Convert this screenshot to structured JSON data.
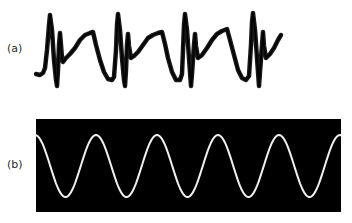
{
  "figure": {
    "panels": [
      {
        "label": "(a)",
        "description": "Noisy biological signal trace (ECG-like) with sharp spikes followed by a broad plateau",
        "trace_color": "#000000",
        "background": "#ffffff",
        "points": [
          [
            36,
            74
          ],
          [
            40,
            75
          ],
          [
            43,
            73
          ],
          [
            45,
            68
          ],
          [
            47,
            50
          ],
          [
            49,
            25
          ],
          [
            50,
            15
          ],
          [
            52,
            30
          ],
          [
            54,
            60
          ],
          [
            56,
            80
          ],
          [
            57,
            86
          ],
          [
            58,
            70
          ],
          [
            59,
            45
          ],
          [
            60,
            33
          ],
          [
            61,
            45
          ],
          [
            62,
            58
          ],
          [
            63,
            62
          ],
          [
            66,
            58
          ],
          [
            70,
            54
          ],
          [
            75,
            48
          ],
          [
            80,
            40
          ],
          [
            85,
            35
          ],
          [
            90,
            33
          ],
          [
            93,
            32
          ],
          [
            96,
            45
          ],
          [
            100,
            60
          ],
          [
            104,
            72
          ],
          [
            108,
            79
          ],
          [
            112,
            80
          ],
          [
            114,
            77
          ],
          [
            116,
            50
          ],
          [
            117,
            25
          ],
          [
            118,
            14
          ],
          [
            120,
            30
          ],
          [
            122,
            58
          ],
          [
            124,
            80
          ],
          [
            125,
            86
          ],
          [
            126,
            70
          ],
          [
            127,
            45
          ],
          [
            128,
            34
          ],
          [
            129,
            46
          ],
          [
            131,
            58
          ],
          [
            134,
            56
          ],
          [
            138,
            52
          ],
          [
            143,
            45
          ],
          [
            148,
            38
          ],
          [
            153,
            35
          ],
          [
            158,
            33
          ],
          [
            162,
            32
          ],
          [
            165,
            44
          ],
          [
            168,
            58
          ],
          [
            172,
            72
          ],
          [
            176,
            80
          ],
          [
            180,
            80
          ],
          [
            182,
            74
          ],
          [
            183,
            50
          ],
          [
            184,
            25
          ],
          [
            185,
            14
          ],
          [
            187,
            30
          ],
          [
            189,
            58
          ],
          [
            191,
            86
          ],
          [
            192,
            74
          ],
          [
            194,
            45
          ],
          [
            195,
            34
          ],
          [
            196,
            46
          ],
          [
            198,
            58
          ],
          [
            202,
            55
          ],
          [
            207,
            48
          ],
          [
            212,
            40
          ],
          [
            217,
            34
          ],
          [
            222,
            31
          ],
          [
            227,
            29
          ],
          [
            230,
            40
          ],
          [
            234,
            55
          ],
          [
            238,
            70
          ],
          [
            242,
            78
          ],
          [
            246,
            80
          ],
          [
            249,
            76
          ],
          [
            251,
            45
          ],
          [
            252,
            22
          ],
          [
            253,
            13
          ],
          [
            255,
            30
          ],
          [
            257,
            58
          ],
          [
            259,
            86
          ],
          [
            260,
            72
          ],
          [
            262,
            45
          ],
          [
            263,
            32
          ],
          [
            264,
            46
          ],
          [
            266,
            58
          ],
          [
            270,
            54
          ],
          [
            274,
            48
          ],
          [
            278,
            40
          ],
          [
            281,
            35
          ]
        ]
      },
      {
        "label": "(b)",
        "description": "Clean sinusoidal wave on black oscilloscope-style background",
        "trace_color": "#f0f0f0",
        "background": "#000000",
        "box": {
          "x": 36,
          "y": 119,
          "width": 305,
          "height": 93
        },
        "sine": {
          "x_start": 36,
          "x_end": 341,
          "center_y": 166,
          "amplitude": 31,
          "period": 61,
          "phase_crest_x": 35
        }
      }
    ]
  }
}
